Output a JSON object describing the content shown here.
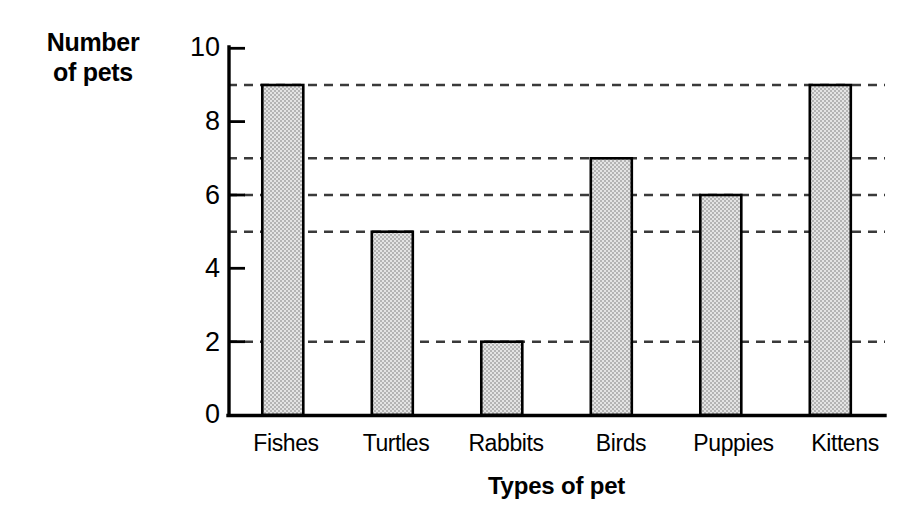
{
  "chart_data": {
    "type": "bar",
    "title": "",
    "categories": [
      "Fishes",
      "Turtles",
      "Rabbits",
      "Birds",
      "Puppies",
      "Kittens"
    ],
    "values": [
      9,
      5,
      2,
      7,
      6,
      9
    ],
    "series": [
      {
        "name": "Number of pets",
        "values": [
          9,
          5,
          2,
          7,
          6,
          9
        ]
      }
    ],
    "xlabel": "Types of pet",
    "ylabel": "Number of pets",
    "ylabel_lines": [
      "Number",
      "of pets"
    ],
    "ylim": [
      0,
      10
    ],
    "y_ticks": [
      0,
      2,
      4,
      6,
      8,
      10
    ],
    "y_tick_labels": [
      "0",
      "2",
      "4",
      "6",
      "8",
      "10"
    ],
    "gridlines": [
      9,
      7,
      6,
      5,
      2
    ],
    "grid": "horizontal-dashed-at-bar-tops",
    "legend": "none",
    "legend_position": "none",
    "bar_fill_color": "#cdcdcd",
    "bar_edge_color": "#000000",
    "axis_color": "#000000",
    "gridline_color": "#333333",
    "background_color": "#ffffff"
  },
  "axis": {
    "y_title_line1": "Number",
    "y_title_line2": "of pets",
    "x_title": "Types of pet",
    "tick_0": "0",
    "tick_2": "2",
    "tick_4": "4",
    "tick_6": "6",
    "tick_8": "8",
    "tick_10": "10"
  },
  "categories": {
    "c0": "Fishes",
    "c1": "Turtles",
    "c2": "Rabbits",
    "c3": "Birds",
    "c4": "Puppies",
    "c5": "Kittens"
  }
}
